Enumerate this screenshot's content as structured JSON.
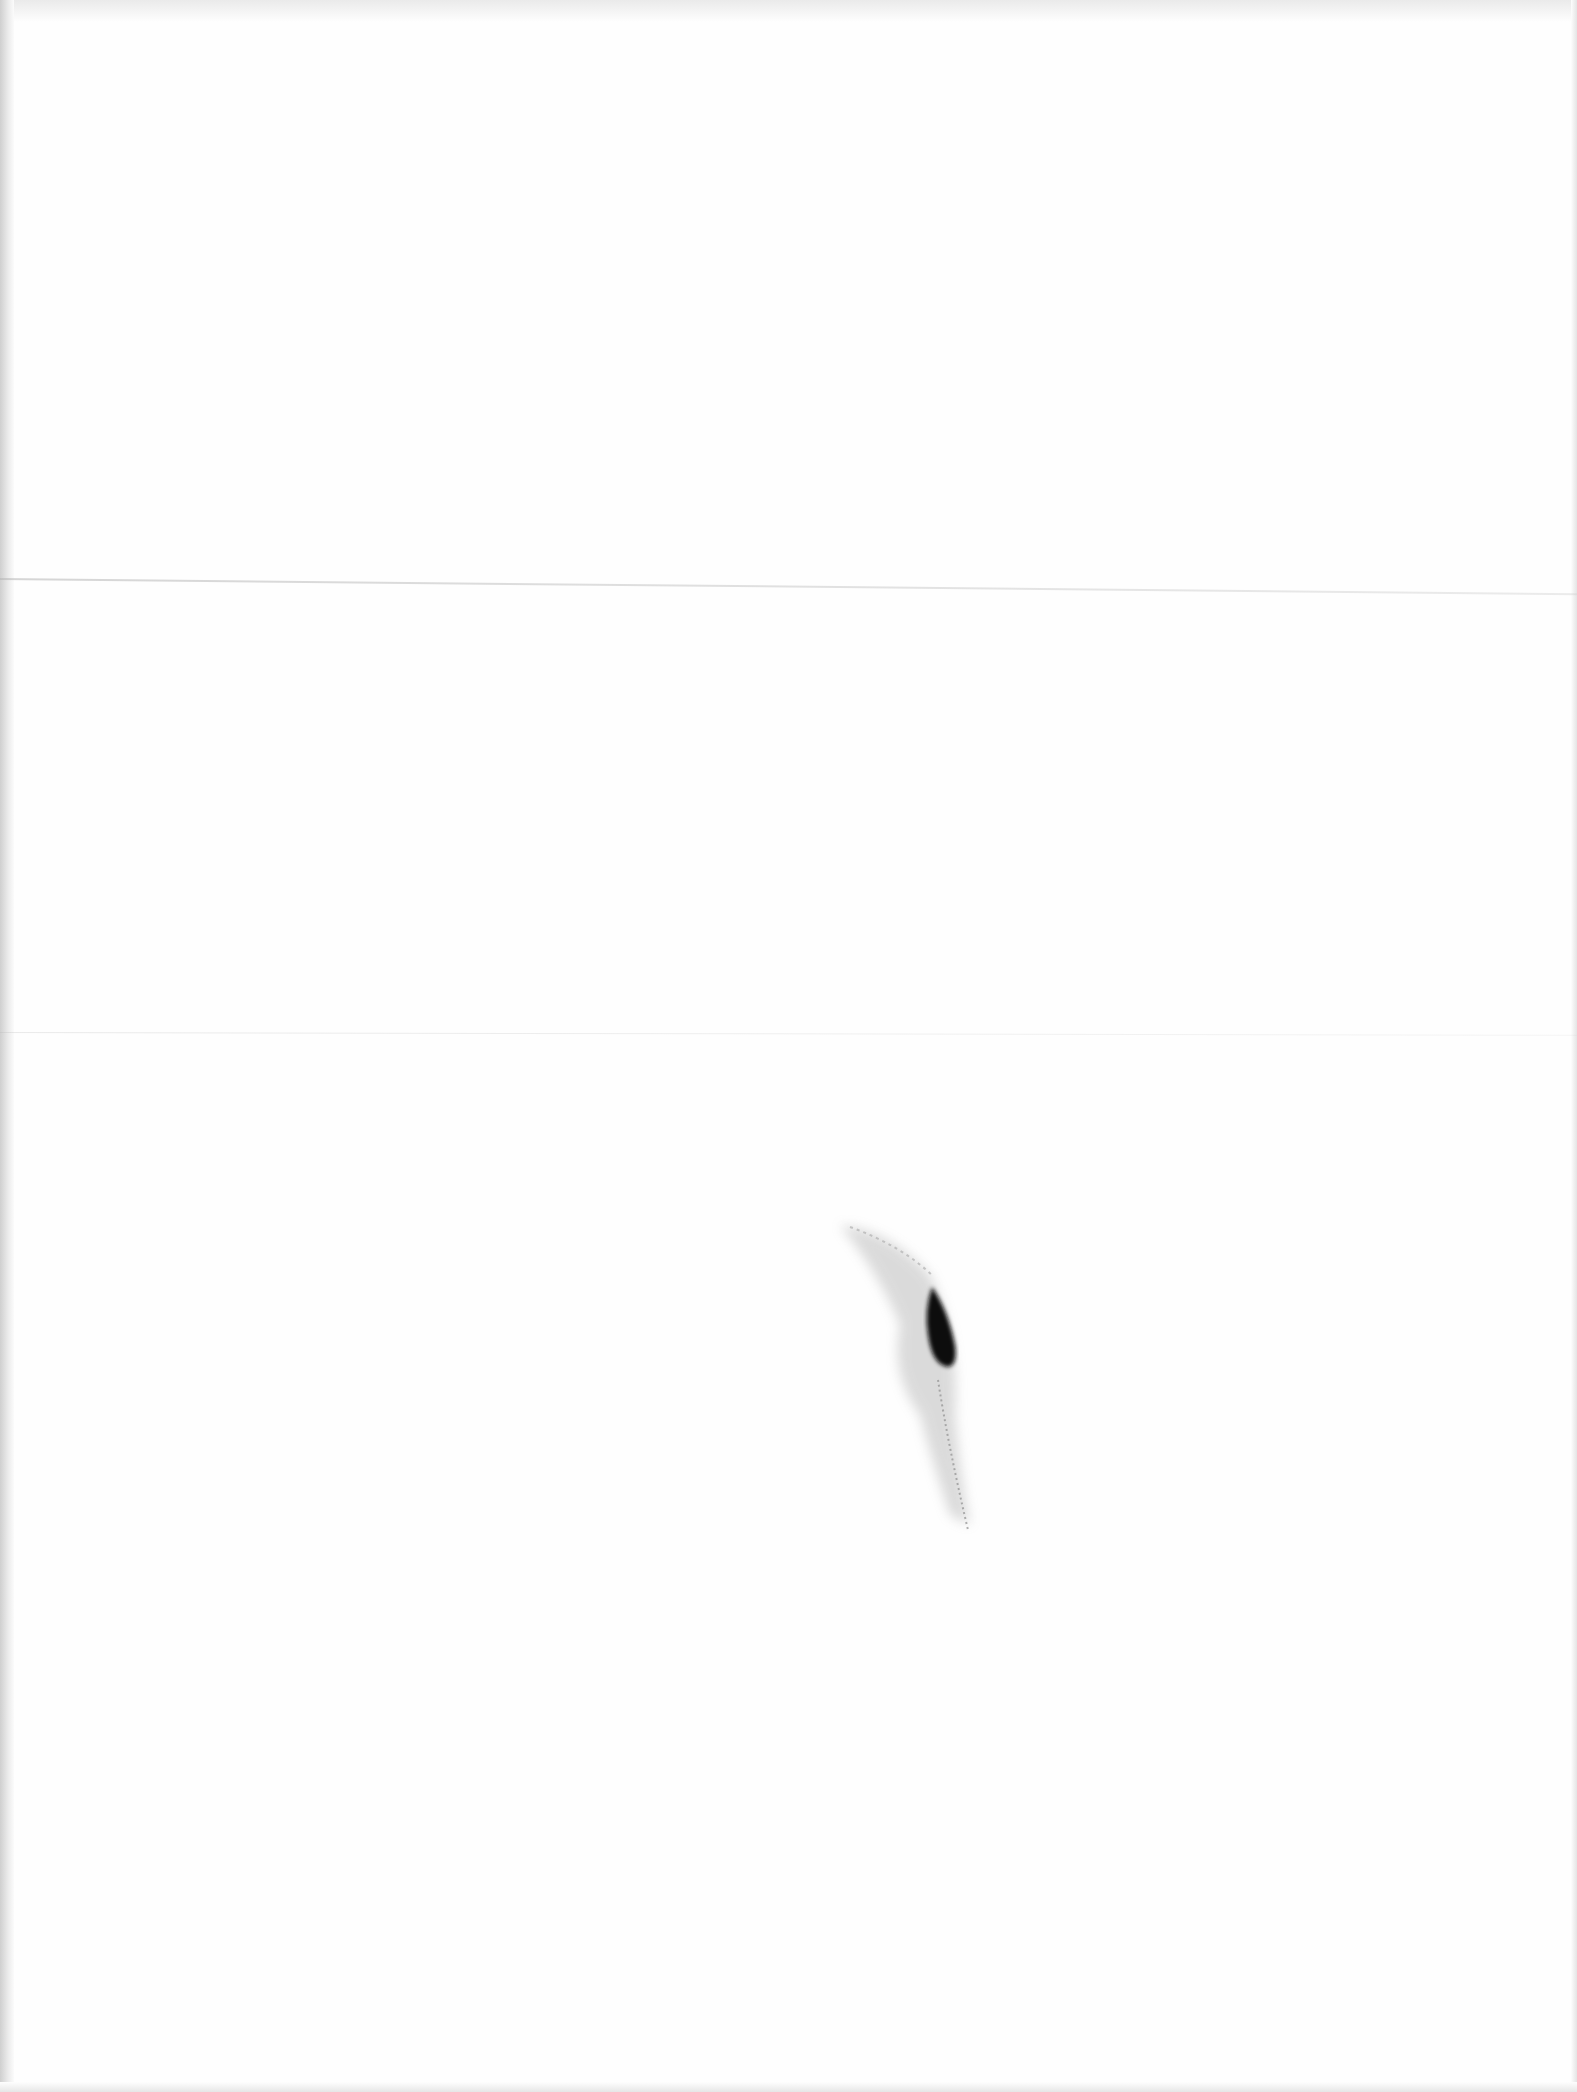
{
  "page": {
    "type": "scanned-blank-page",
    "background_color": "#fefefe",
    "text_content": ""
  },
  "artifacts": {
    "fold_creases": [
      {
        "y": 578,
        "color": "#b4b4b4"
      },
      {
        "y": 1032,
        "color": "#d0d0d0"
      }
    ],
    "ink_smudge": {
      "x": 820,
      "y": 1215,
      "width": 160,
      "height": 320,
      "core_color": "#111111",
      "halo_color": "#9a9a9a"
    },
    "left_edge_shadow_color": "#cfcfcf"
  }
}
